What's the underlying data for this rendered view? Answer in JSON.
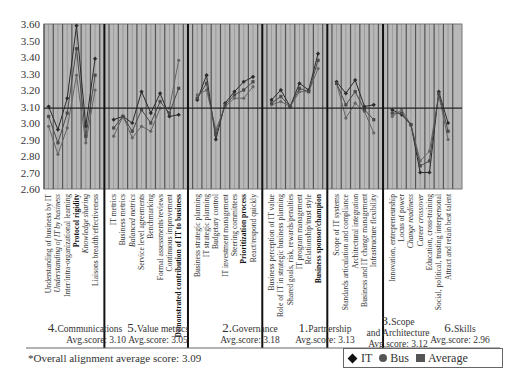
{
  "chart_data": {
    "type": "line",
    "title": "",
    "xlabel": "",
    "ylabel": "",
    "ylim": [
      2.6,
      3.6
    ],
    "yticks": [
      "3.60",
      "3.50",
      "3.40",
      "3.30",
      "3.20",
      "3.10",
      "3.00",
      "2.90",
      "2.80",
      "2.70",
      "2.60"
    ],
    "reference_line": 3.09,
    "grid": "vertical",
    "legend_position": "bottom-right",
    "legend": [
      "IT",
      "Bus",
      "Average"
    ],
    "sections": [
      {
        "number": "4.",
        "name": "Communications",
        "avg_label": "Avg.score: 3.10",
        "categories": [
          "Understanding of business by IT",
          "Understanding of IT by business",
          "Inter/intra-organizational learning",
          "Protocol rigidity",
          "Knowledge sharing",
          "Liaisons breadth/effectiveness"
        ],
        "styles": [
          "normal",
          "italic",
          "normal",
          "bold",
          "italic",
          "normal"
        ],
        "series": [
          {
            "name": "IT",
            "values": [
              3.1,
              2.96,
              3.15,
              3.59,
              2.98,
              3.39
            ]
          },
          {
            "name": "Bus",
            "values": [
              2.98,
              2.81,
              2.97,
              3.29,
              2.88,
              3.2
            ]
          },
          {
            "name": "Average",
            "values": [
              3.04,
              2.88,
              3.06,
              3.45,
              2.92,
              3.29
            ]
          }
        ]
      },
      {
        "number": "5.",
        "name": "Value metrics",
        "avg_label": "Avg.score: 3.05",
        "categories": [
          "IT metrics",
          "Business metrics",
          "Balanced metrics",
          "Service level agreements",
          "Benchmarking",
          "Formal assessments/reviews",
          "Continuous improvement",
          "Demonstrated contribution of IT to business"
        ],
        "styles": [
          "normal",
          "normal",
          "italic",
          "normal",
          "normal",
          "normal",
          "normal",
          "bold"
        ],
        "series": [
          {
            "name": "IT",
            "values": [
              3.02,
              3.04,
              3.0,
              3.19,
              3.06,
              3.18,
              3.04,
              3.05
            ]
          },
          {
            "name": "Bus",
            "values": [
              2.92,
              3.04,
              2.91,
              2.98,
              2.95,
              3.09,
              3.09,
              3.38
            ]
          },
          {
            "name": "Average",
            "values": [
              2.97,
              3.04,
              2.95,
              3.08,
              3.0,
              3.13,
              3.06,
              3.21
            ]
          }
        ]
      },
      {
        "number": "2.",
        "name": "Governance",
        "avg_label": "Avg.score: 3.18",
        "categories": [
          "Business strategic planning",
          "IT strategic planning",
          "Budgetary control",
          "IT investment management",
          "Steering committees",
          "Prioritization process",
          "React/respond quickly"
        ],
        "styles": [
          "normal",
          "normal",
          "normal",
          "normal",
          "normal",
          "bold",
          "normal"
        ],
        "series": [
          {
            "name": "IT",
            "values": [
              3.14,
              3.29,
              2.9,
              3.12,
              3.19,
              3.25,
              3.28
            ]
          },
          {
            "name": "Bus",
            "values": [
              3.17,
              3.2,
              2.96,
              3.1,
              3.15,
              3.15,
              3.22
            ]
          },
          {
            "name": "Average",
            "values": [
              3.15,
              3.24,
              2.93,
              3.11,
              3.17,
              3.2,
              3.25
            ]
          }
        ]
      },
      {
        "number": "1.",
        "name": "Partnership",
        "avg_label": "Avg.score: 3.13",
        "categories": [
          "Business perception of IT value",
          "Role of IT in strategic business planning",
          "Shared goals, risk, rewards/penalties",
          "IT program management",
          "Relationship/trust style",
          "Business sponsor/champion"
        ],
        "styles": [
          "normal",
          "normal",
          "normal",
          "normal",
          "normal",
          "bold"
        ],
        "series": [
          {
            "name": "IT",
            "values": [
              3.14,
              3.2,
              3.1,
              3.24,
              3.2,
              3.42
            ]
          },
          {
            "name": "Bus",
            "values": [
              3.11,
              3.13,
              3.1,
              3.19,
              3.19,
              3.33
            ]
          },
          {
            "name": "Average",
            "values": [
              3.12,
              3.16,
              3.1,
              3.21,
              3.19,
              3.38
            ]
          }
        ]
      },
      {
        "number": "3.",
        "name": "Scope and Architecture",
        "avg_label": "Avg.score: 3.12",
        "categories": [
          "Scope of IT systems",
          "Standards articulation and compliance",
          "Architectural integration",
          "Business and IT change management",
          "Infrastructure flexibility"
        ],
        "styles": [
          "normal",
          "normal",
          "normal",
          "normal",
          "normal"
        ],
        "series": [
          {
            "name": "IT",
            "values": [
              3.25,
              3.18,
              3.26,
              3.1,
              3.11
            ]
          },
          {
            "name": "Bus",
            "values": [
              3.24,
              3.03,
              3.12,
              3.07,
              2.94
            ]
          },
          {
            "name": "Average",
            "values": [
              3.24,
              3.11,
              3.19,
              3.08,
              3.02
            ]
          }
        ]
      },
      {
        "number": "6.",
        "name": "Skills",
        "avg_label": "Avg.score: 2.96",
        "categories": [
          "Innovation, entrepreneurship",
          "Locus of power",
          "Change readiness",
          "Career crossover",
          "Education, cross-training",
          "Social, political, trusting interpersonal",
          "Attract and retain best talent"
        ],
        "styles": [
          "normal",
          "normal",
          "italic",
          "italic",
          "normal",
          "normal",
          "normal"
        ],
        "series": [
          {
            "name": "IT",
            "values": [
              3.08,
              3.05,
              2.99,
              2.7,
              2.7,
              3.19,
              3.0
            ]
          },
          {
            "name": "Bus",
            "values": [
              3.04,
              3.08,
              2.99,
              2.77,
              2.83,
              3.17,
              2.9
            ]
          },
          {
            "name": "Average",
            "values": [
              3.06,
              3.06,
              2.99,
              2.74,
              2.77,
              3.18,
              2.95
            ]
          }
        ]
      }
    ]
  },
  "footnote": "*Overall alignment average score: 3.09",
  "legend": {
    "items": [
      {
        "label": "IT",
        "marker": "diamond",
        "color": "#111111"
      },
      {
        "label": "Bus",
        "marker": "circle",
        "color": "#555555"
      },
      {
        "label": "Average",
        "marker": "square",
        "color": "#555555"
      }
    ]
  },
  "colors": {
    "plot_bg": "#b8b8b8",
    "grid": "#555555",
    "divider": "#111111",
    "it_line": "#2a2a2a",
    "bus_line": "#666666",
    "avg_line": "#4a4a4a",
    "ref_line": "#222222"
  },
  "section_titles": [
    {
      "num": "4.",
      "name": "Communications",
      "avg": "Avg.score: 3.10"
    },
    {
      "num": "5.",
      "name": "Value metrics",
      "avg": "Avg.score: 3.05"
    },
    {
      "num": "2.",
      "name": "Governance",
      "avg": "Avg.score: 3.18"
    },
    {
      "num": "1.",
      "name": "Partnership",
      "avg": "Avg.score: 3.13"
    },
    {
      "num": "3.",
      "name": "Scope",
      "name2": "and Architecture",
      "avg": "Avg.score: 3.12"
    },
    {
      "num": "6.",
      "name": "Skills",
      "avg": "Avg.score: 2.96"
    }
  ]
}
